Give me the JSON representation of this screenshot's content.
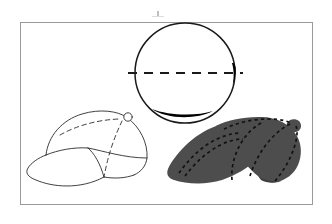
{
  "figure": {
    "caption": "Technical illustration sheet: top plan view of cap crown with centerline, three-quarter line drawing of a cap, and shaded rendering of a cap with stitch detail.",
    "background_color": "#ffffff",
    "frame": {
      "label": "figure-border",
      "stroke_color": "#9a9a9a",
      "stroke_width": 1,
      "x": 20,
      "y": 22,
      "width": 293,
      "height": 183
    },
    "artifact_mark": {
      "label": "scan-tick-mark",
      "color": "#b8b8b8",
      "x": 157,
      "y": 11,
      "width": 2,
      "height": 6
    }
  },
  "views": [
    {
      "id": "top-view",
      "label": "Top plan view of cap crown",
      "shape": "circle",
      "center_x": 185,
      "center_y": 73,
      "radius": 50,
      "outline_color": "#1a1a1a",
      "outline_width": 1.4,
      "fill_color": "#ffffff",
      "centerline": {
        "label": "horizontal-centerline",
        "style": "dashed",
        "color": "#1a1a1a",
        "width": 1.8,
        "dash_pattern": "9 7",
        "x1": 128,
        "x2": 242,
        "y": 73
      },
      "shading": [
        {
          "label": "right-crescent-shadow",
          "color": "#000000"
        },
        {
          "label": "bottom-crescent-shadow",
          "color": "#000000"
        }
      ]
    },
    {
      "id": "line-view",
      "label": "Three-quarter line drawing of cap",
      "style": "outline",
      "stroke_color": "#2b2b2b",
      "stroke_width": 1,
      "fill_color": "#ffffff",
      "parts": [
        {
          "label": "crown-outline",
          "style": "solid"
        },
        {
          "label": "visor-outline",
          "style": "solid"
        },
        {
          "label": "front-panel-seam",
          "style": "solid"
        },
        {
          "label": "crown-seam-left",
          "style": "dashed",
          "dash_pattern": "4 3"
        },
        {
          "label": "crown-seam-center",
          "style": "dashed",
          "dash_pattern": "4 3"
        },
        {
          "label": "button",
          "style": "solid",
          "shape": "circle"
        }
      ]
    },
    {
      "id": "shaded-view",
      "label": "Shaded rendering of cap with stitching",
      "style": "filled",
      "fill_color": "#4d4d4d",
      "fill_color_dark": "#3f3f3f",
      "stitch_color": "#111111",
      "stitch_width": 1.6,
      "stitch_dash_pattern": "3 3",
      "parts": [
        {
          "label": "crown-body"
        },
        {
          "label": "visor-body"
        },
        {
          "label": "button-nub"
        },
        {
          "label": "visor-stitch-outer",
          "style": "dashed"
        },
        {
          "label": "visor-stitch-inner",
          "style": "dashed"
        },
        {
          "label": "crown-seam-front",
          "style": "dashed"
        },
        {
          "label": "crown-seam-mid",
          "style": "dashed"
        },
        {
          "label": "crown-seam-back",
          "style": "dashed"
        },
        {
          "label": "crown-seam-top",
          "style": "dashed"
        }
      ]
    }
  ]
}
